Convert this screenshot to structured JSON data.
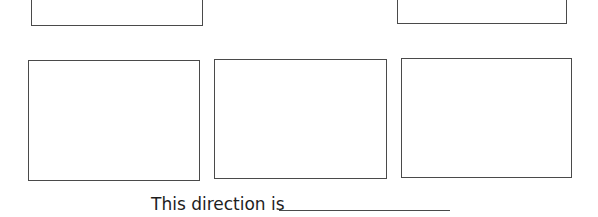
{
  "worksheet": {
    "top_row_boxes": [
      {
        "id": "top-left",
        "content": ""
      },
      {
        "id": "top-right",
        "content": ""
      }
    ],
    "bottom_row_boxes": [
      {
        "id": "bottom-1",
        "content": ""
      },
      {
        "id": "bottom-2",
        "content": ""
      },
      {
        "id": "bottom-3",
        "content": ""
      }
    ],
    "prompt": {
      "text": "This direction is",
      "answer": ""
    }
  }
}
